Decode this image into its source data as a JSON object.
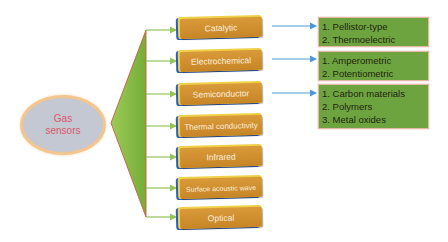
{
  "diagram": {
    "root": {
      "line1": "Gas",
      "line2": "sensors"
    },
    "categories": [
      {
        "label": "Catalytic"
      },
      {
        "label": "Electrochemical"
      },
      {
        "label": "Semiconductor"
      },
      {
        "label": "Thermal conductivity"
      },
      {
        "label": "Infrared"
      },
      {
        "label": "Surface acoustic wave"
      },
      {
        "label": "Optical"
      }
    ],
    "details": [
      {
        "for": "Catalytic",
        "items": [
          "1. Pellistor-type",
          "2. Thermoelectric"
        ]
      },
      {
        "for": "Electrochemical",
        "items": [
          "1. Amperometric",
          "2. Potentiometric"
        ]
      },
      {
        "for": "Semiconductor",
        "items": [
          "1. Carbon materials",
          "2. Polymers",
          "3. Metal oxides"
        ]
      }
    ],
    "colors": {
      "root_fill": "#c3c8d2",
      "root_border": "#f3c58f",
      "root_text": "#d9586a",
      "triangle_fill": "#86bd45",
      "triangle_stroke": "#c9684b",
      "connector_green": "#93c45a",
      "connector_blue": "#4a9ad8",
      "box_orange": "#d3922f",
      "box_blue_edge": "#2d5fb8",
      "box_yellow_edge": "#f0d24a",
      "detail_green": "#6ea43f"
    }
  }
}
